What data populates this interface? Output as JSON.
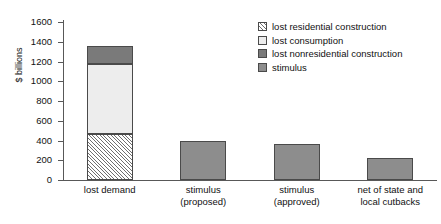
{
  "chart_data": {
    "type": "bar",
    "title": "",
    "xlabel": "",
    "ylabel": "$ billions",
    "ylim": [
      0,
      1600
    ],
    "yticks": [
      0,
      200,
      400,
      600,
      800,
      1000,
      1200,
      1400,
      1600
    ],
    "grid": false,
    "stacked": true,
    "legend_position": "top-right",
    "categories": [
      "lost demand",
      "stimulus\n(proposed)",
      "stimulus\n(approved)",
      "net of state and\nlocal cutbacks"
    ],
    "category_lines": [
      [
        "lost demand"
      ],
      [
        "stimulus",
        "(proposed)"
      ],
      [
        "stimulus",
        "(approved)"
      ],
      [
        "net of state and",
        "local cutbacks"
      ]
    ],
    "series": [
      {
        "name": "lost residential construction",
        "swatch": "hatch",
        "color": "#ffffff",
        "values": [
          470,
          0,
          0,
          0
        ]
      },
      {
        "name": "lost consumption",
        "swatch": "light",
        "color": "#ededed",
        "values": [
          700,
          0,
          0,
          0
        ]
      },
      {
        "name": "lost nonresidential construction",
        "swatch": "dark",
        "color": "#7a7a7a",
        "values": [
          190,
          0,
          0,
          0
        ]
      },
      {
        "name": "stimulus",
        "swatch": "mid",
        "color": "#8d8d8d",
        "values": [
          0,
          400,
          360,
          220
        ]
      }
    ],
    "totals": [
      1360,
      400,
      360,
      220
    ]
  },
  "legend": {
    "items": [
      {
        "label": "lost residential construction"
      },
      {
        "label": "lost consumption"
      },
      {
        "label": "lost nonresidential construction"
      },
      {
        "label": "stimulus"
      }
    ]
  }
}
